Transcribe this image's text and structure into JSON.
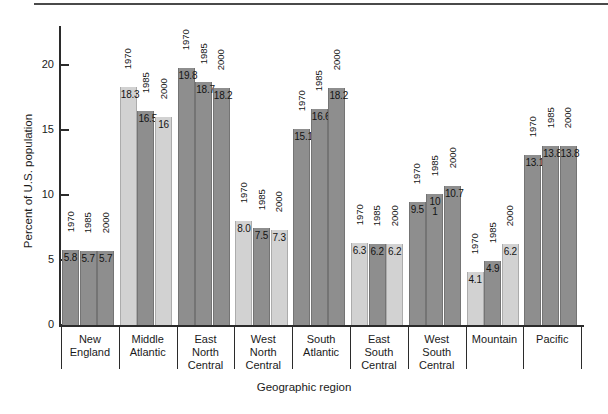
{
  "figure": {
    "background": "#ffffff",
    "rule_color": "#4a4a4a"
  },
  "chart_data": {
    "type": "bar",
    "title": "",
    "xlabel": "Geographic region",
    "ylabel": "Percent of U.S. population",
    "ylim": [
      0,
      22.5
    ],
    "yticks": [
      "0",
      "5",
      "10",
      "15",
      "20"
    ],
    "grid": false,
    "legend": "none",
    "categories": [
      "New England",
      "Middle Atlantic",
      "East North Central",
      "West North Central",
      "South Atlantic",
      "East South Central",
      "West South Central",
      "Mountain",
      "Pacific"
    ],
    "series": [
      {
        "name": "1970",
        "values": [
          5.8,
          18.3,
          19.8,
          8.0,
          15.1,
          6.3,
          9.5,
          4.1,
          13.1
        ]
      },
      {
        "name": "1985",
        "values": [
          5.7,
          16.5,
          18.7,
          7.5,
          16.6,
          6.2,
          10.1,
          4.9,
          13.8
        ]
      },
      {
        "name": "2000",
        "values": [
          5.7,
          16.0,
          18.2,
          7.3,
          18.2,
          6.2,
          10.7,
          6.2,
          13.8
        ]
      }
    ],
    "bar_labels": [
      [
        "5.8",
        "5.7",
        "5.7"
      ],
      [
        "18.3",
        "16.5",
        "16"
      ],
      [
        "19.8",
        "18.7",
        "18.2"
      ],
      [
        "8.0",
        "7.5",
        "7.3"
      ],
      [
        "15.1",
        "16.6",
        "18.2"
      ],
      [
        "6.3",
        "6.2",
        "6.2"
      ],
      [
        "9.5",
        "10 1",
        "10.7"
      ],
      [
        "4.1",
        "4.9",
        "6.2"
      ],
      [
        "13.1",
        "13.8",
        "13.8"
      ]
    ],
    "bar_shades": [
      [
        "dark",
        "dark",
        "dark"
      ],
      [
        "light",
        "dark",
        "light"
      ],
      [
        "dark",
        "dark",
        "dark"
      ],
      [
        "light",
        "dark",
        "light"
      ],
      [
        "dark",
        "dark",
        "dark"
      ],
      [
        "light",
        "dark",
        "light"
      ],
      [
        "dark",
        "dark",
        "dark"
      ],
      [
        "light",
        "dark",
        "light"
      ],
      [
        "dark",
        "dark",
        "dark"
      ]
    ],
    "shade_colors": {
      "light": "#d2d2d2",
      "dark": "#8e8e8e"
    },
    "category_label_lines": [
      [
        "New",
        "England"
      ],
      [
        "Middle",
        "Atlantic"
      ],
      [
        "East",
        "North",
        "Central"
      ],
      [
        "West",
        "North",
        "Central"
      ],
      [
        "South",
        "Atlantic"
      ],
      [
        "East",
        "South",
        "Central"
      ],
      [
        "West",
        "South",
        "Central"
      ],
      [
        "Mountain"
      ],
      [
        "Pacific"
      ]
    ]
  }
}
